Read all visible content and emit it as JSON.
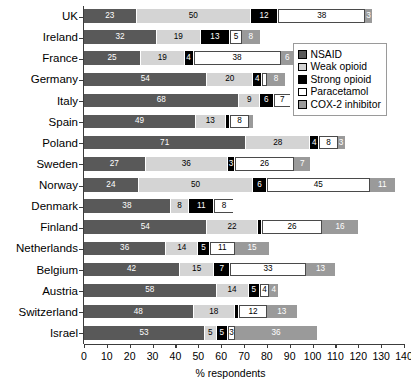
{
  "chart_data": {
    "type": "bar",
    "orientation": "horizontal",
    "stacked": true,
    "title": "",
    "xlabel": "% respondents",
    "ylabel": "",
    "xlim": [
      0,
      140
    ],
    "xticks": [
      0,
      10,
      20,
      30,
      40,
      50,
      60,
      70,
      80,
      90,
      100,
      110,
      120,
      130,
      140
    ],
    "grid": false,
    "legend_position": "upper right",
    "categories": [
      "UK",
      "Ireland",
      "France",
      "Germany",
      "Italy",
      "Spain",
      "Poland",
      "Sweden",
      "Norway",
      "Denmark",
      "Finland",
      "Netherlands",
      "Belgium",
      "Austria",
      "Switzerland",
      "Israel"
    ],
    "series": [
      {
        "name": "NSAID",
        "color": "#595959",
        "text_color": "#ffffff",
        "values": [
          23,
          32,
          25,
          54,
          68,
          49,
          71,
          27,
          24,
          38,
          54,
          36,
          42,
          58,
          48,
          53
        ]
      },
      {
        "name": "Weak opioid",
        "color": "#d4d4d4",
        "text_color": "#000000",
        "values": [
          50,
          19,
          19,
          20,
          9,
          13,
          28,
          36,
          50,
          8,
          22,
          14,
          15,
          14,
          18,
          5
        ]
      },
      {
        "name": "Strong opioid",
        "color": "#000000",
        "text_color": "#ffffff",
        "values": [
          12,
          13,
          4,
          4,
          6,
          2,
          4,
          3,
          6,
          11,
          2,
          5,
          7,
          5,
          2,
          5
        ]
      },
      {
        "name": "Paracetamol",
        "color": "#ffffff",
        "text_color": "#000000",
        "values": [
          38,
          5,
          38,
          2,
          7,
          8,
          8,
          26,
          45,
          8,
          26,
          11,
          33,
          4,
          12,
          3
        ]
      },
      {
        "name": "COX-2 inhibitor",
        "color": "#9a9a9a",
        "text_color": "#ffffff",
        "values": [
          3,
          8,
          6,
          8,
          0,
          2,
          3,
          7,
          11,
          0,
          16,
          15,
          13,
          4,
          13,
          36
        ]
      }
    ],
    "totals": [
      126,
      77,
      92,
      88,
      90,
      74,
      114,
      99,
      136,
      65,
      120,
      81,
      110,
      85,
      93,
      102
    ]
  },
  "legend": {
    "items": [
      {
        "label": "NSAID",
        "color": "#595959"
      },
      {
        "label": "Weak opioid",
        "color": "#d4d4d4"
      },
      {
        "label": "Strong opioid",
        "color": "#000000"
      },
      {
        "label": "Paracetamol",
        "color": "#ffffff"
      },
      {
        "label": "COX-2 inhibitor",
        "color": "#9a9a9a"
      }
    ]
  }
}
